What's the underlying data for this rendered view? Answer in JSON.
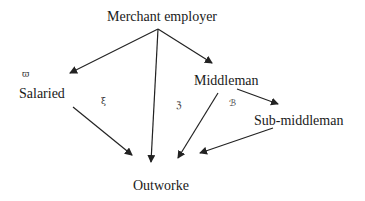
{
  "diagram": {
    "nodes": [
      {
        "id": "merchant",
        "label": "Merchant employer"
      },
      {
        "id": "salaried",
        "label": "Salaried"
      },
      {
        "id": "middleman",
        "label": "Middleman"
      },
      {
        "id": "submiddleman",
        "label": "Sub-middleman"
      },
      {
        "id": "outworker",
        "label": "Outworke"
      }
    ],
    "edges": [
      {
        "from": "merchant",
        "to": "salaried"
      },
      {
        "from": "merchant",
        "to": "middleman"
      },
      {
        "from": "merchant",
        "to": "outworker"
      },
      {
        "from": "salaried",
        "to": "outworker"
      },
      {
        "from": "middleman",
        "to": "outworker"
      },
      {
        "from": "middleman",
        "to": "submiddleman"
      },
      {
        "from": "submiddleman",
        "to": "outworker"
      }
    ],
    "marks": [
      "ϖ",
      "ξ",
      "ℨ",
      "ℬ"
    ],
    "colors": {
      "line": "#222222",
      "text": "#1a1a1a",
      "background": "#ffffff"
    }
  }
}
